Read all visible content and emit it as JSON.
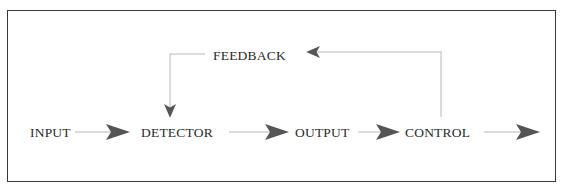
{
  "diagram": {
    "type": "block-flow",
    "nodes": [
      {
        "id": "input",
        "label": "INPUT"
      },
      {
        "id": "detector",
        "label": "DETECTOR"
      },
      {
        "id": "output",
        "label": "OUTPUT"
      },
      {
        "id": "control",
        "label": "CONTROL"
      },
      {
        "id": "feedback",
        "label": "FEEDBACK"
      }
    ],
    "edges": [
      {
        "from": "input",
        "to": "detector"
      },
      {
        "from": "detector",
        "to": "output"
      },
      {
        "from": "output",
        "to": "control"
      },
      {
        "from": "control",
        "to": "exit"
      },
      {
        "from": "control",
        "to": "feedback"
      },
      {
        "from": "feedback",
        "to": "detector"
      }
    ],
    "colors": {
      "border": "#3a3a3a",
      "line": "#cfcfcf",
      "arrowhead": "#555555",
      "text": "#2a2a2a"
    }
  }
}
